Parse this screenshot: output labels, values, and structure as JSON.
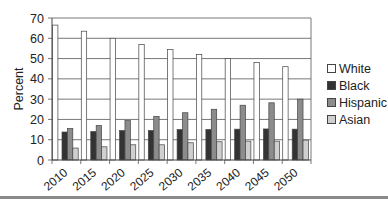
{
  "chart_data": {
    "type": "bar",
    "title": "",
    "xlabel": "",
    "ylabel": "Percent",
    "ylim": [
      0,
      70
    ],
    "yticks": [
      0,
      10,
      20,
      30,
      40,
      50,
      60,
      70
    ],
    "grid": true,
    "legend_position": "right",
    "categories": [
      "2010",
      "2015",
      "2020",
      "2025",
      "2030",
      "2035",
      "2040",
      "2045",
      "2050"
    ],
    "series": [
      {
        "name": "White",
        "color": "#ffffff",
        "values": [
          66.5,
          63.5,
          60,
          57,
          54.5,
          52,
          50,
          48,
          46
        ]
      },
      {
        "name": "Black",
        "color": "#333333",
        "values": [
          13.8,
          14,
          14.5,
          14.5,
          15,
          15,
          15.2,
          15.3,
          15.2
        ]
      },
      {
        "name": "Hispanic",
        "color": "#8c8c8c",
        "values": [
          15.5,
          17,
          19.4,
          21.5,
          23.3,
          25,
          27,
          28.2,
          30
        ]
      },
      {
        "name": "Asian",
        "color": "#cfcfcf",
        "values": [
          5.9,
          6.5,
          7.5,
          7.5,
          8.5,
          9,
          9.3,
          9.3,
          9.8
        ]
      }
    ]
  }
}
